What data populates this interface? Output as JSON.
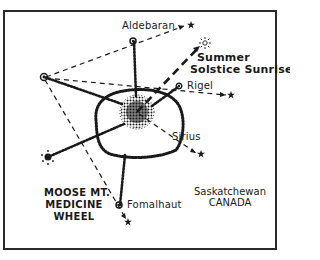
{
  "diagram": {
    "title_lines": [
      "MOOSE MT.",
      "MEDICINE",
      "WHEEL"
    ],
    "location_lines": [
      "Saskatchewan",
      "CANADA"
    ],
    "alignments": [
      {
        "label": "Aldebaran",
        "kind": "star"
      },
      {
        "label": "Summer",
        "label2": "Solstice Sunrise",
        "kind": "sun"
      },
      {
        "label": "Rigel",
        "kind": "star"
      },
      {
        "label": "Sirius",
        "kind": "star"
      },
      {
        "label": "Fomalhaut",
        "kind": "star"
      }
    ],
    "features": {
      "central_cairn": "central-cairn",
      "ring": "stone-ring",
      "spokes": 5,
      "outer_cairns": 5
    },
    "colors": {
      "ink": "#1a1a1a",
      "background": "#ffffff"
    }
  }
}
